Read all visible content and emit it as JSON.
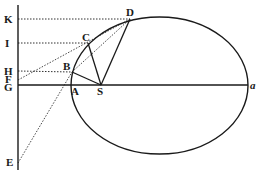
{
  "diagram": {
    "type": "geometric-figure",
    "colors": {
      "ink": "#1a1a1a",
      "background": "#ffffff"
    },
    "ellipse": {
      "cx": 159.5,
      "cy": 85.5,
      "rx": 88.5,
      "ry": 68.5
    },
    "vertical_line": {
      "x": 18,
      "y1": 5,
      "y2": 170
    },
    "axis": {
      "y": 85,
      "x1": 18,
      "x2": 248
    },
    "points": {
      "K": {
        "label": "K",
        "x": 18,
        "y": 19
      },
      "I": {
        "label": "I",
        "x": 18,
        "y": 43
      },
      "H": {
        "label": "H",
        "x": 18,
        "y": 71
      },
      "F": {
        "label": "F",
        "x": 18,
        "y": 80
      },
      "G": {
        "label": "G",
        "x": 18,
        "y": 85
      },
      "E": {
        "label": "E",
        "x": 18,
        "y": 163
      },
      "A": {
        "label": "A",
        "x": 71,
        "y": 85
      },
      "B": {
        "label": "B",
        "x": 72,
        "y": 72
      },
      "C": {
        "label": "C",
        "x": 88,
        "y": 43
      },
      "D": {
        "label": "D",
        "x": 130,
        "y": 19
      },
      "S": {
        "label": "S",
        "x": 101,
        "y": 85
      },
      "a": {
        "label": "a",
        "x": 248,
        "y": 85
      }
    },
    "solid_lines": [
      [
        "S",
        "B"
      ],
      [
        "S",
        "C"
      ],
      [
        "S",
        "D"
      ]
    ],
    "dotted_lines": [
      [
        "K",
        "D"
      ],
      [
        "I",
        "C"
      ],
      [
        "H",
        "B"
      ],
      [
        "F",
        "D"
      ],
      [
        "E",
        "B"
      ],
      [
        "B",
        "D"
      ]
    ]
  }
}
